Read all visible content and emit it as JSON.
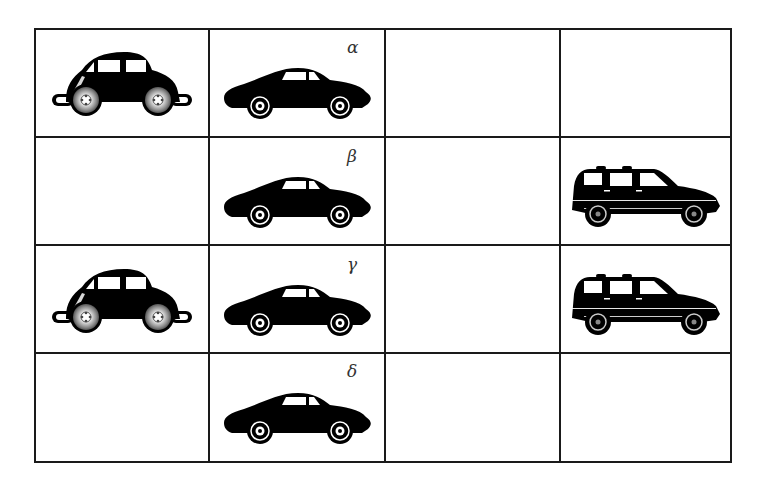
{
  "grid": {
    "rows": 4,
    "cols": 4,
    "col_edges_px": [
      34,
      208,
      384,
      559,
      730
    ],
    "row_edges_px": [
      28,
      137,
      245,
      353,
      461
    ],
    "line_color": "#1a1a1a"
  },
  "cells": [
    {
      "row": 0,
      "col": 0,
      "content": "beetle-car",
      "label": ""
    },
    {
      "row": 0,
      "col": 1,
      "content": "sports-coupe",
      "label": "α"
    },
    {
      "row": 0,
      "col": 2,
      "content": "",
      "label": ""
    },
    {
      "row": 0,
      "col": 3,
      "content": "",
      "label": ""
    },
    {
      "row": 1,
      "col": 0,
      "content": "",
      "label": ""
    },
    {
      "row": 1,
      "col": 1,
      "content": "sports-coupe",
      "label": "β"
    },
    {
      "row": 1,
      "col": 2,
      "content": "",
      "label": ""
    },
    {
      "row": 1,
      "col": 3,
      "content": "suv",
      "label": ""
    },
    {
      "row": 2,
      "col": 0,
      "content": "beetle-car",
      "label": ""
    },
    {
      "row": 2,
      "col": 1,
      "content": "sports-coupe",
      "label": "γ"
    },
    {
      "row": 2,
      "col": 2,
      "content": "",
      "label": ""
    },
    {
      "row": 2,
      "col": 3,
      "content": "suv",
      "label": ""
    },
    {
      "row": 3,
      "col": 0,
      "content": "",
      "label": ""
    },
    {
      "row": 3,
      "col": 1,
      "content": "sports-coupe",
      "label": "δ"
    },
    {
      "row": 3,
      "col": 2,
      "content": "",
      "label": ""
    },
    {
      "row": 3,
      "col": 3,
      "content": "",
      "label": ""
    }
  ],
  "labels": {
    "alpha": "α",
    "beta": "β",
    "gamma": "γ",
    "delta": "δ"
  },
  "icons": {
    "beetle": "beetle-car-icon",
    "coupe": "sports-coupe-icon",
    "suv": "suv-icon"
  }
}
